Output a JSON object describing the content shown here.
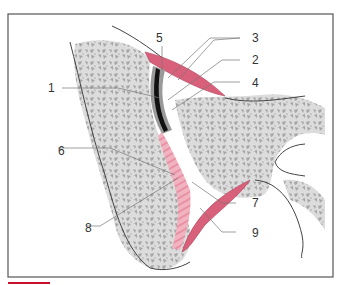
{
  "figure": {
    "type": "anatomical cross-section diagram",
    "labels": [
      {
        "id": "1",
        "text": "1"
      },
      {
        "id": "2",
        "text": "2"
      },
      {
        "id": "3",
        "text": "3"
      },
      {
        "id": "4",
        "text": "4"
      },
      {
        "id": "5",
        "text": "5"
      },
      {
        "id": "6",
        "text": "6"
      },
      {
        "id": "7",
        "text": "7"
      },
      {
        "id": "8",
        "text": "8"
      },
      {
        "id": "9",
        "text": "9"
      }
    ],
    "colors": {
      "frame": "#555555",
      "bone_fill": "#d9d9d9",
      "bone_pattern": "#a8a8a8",
      "membrane_red": "#d9607a",
      "fibrous_pink": "#eeaab8",
      "cartilage_grey": "#9a9a9a",
      "black_layer": "#111111",
      "accent_bar": "#c8102e"
    }
  }
}
